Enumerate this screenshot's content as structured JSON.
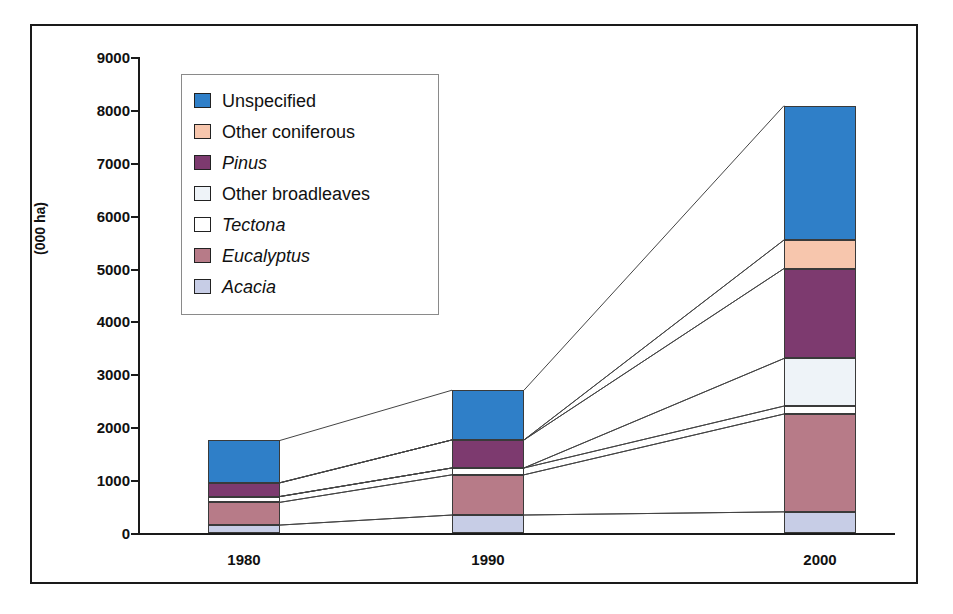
{
  "chart_data": {
    "type": "bar",
    "subtype": "stacked-bar",
    "title": "",
    "subtitle": "",
    "xlabel": "",
    "ylabel": "(000 ha)",
    "categories": [
      "1980",
      "1990",
      "2000"
    ],
    "ylim": [
      0,
      9000
    ],
    "ytick_step": 1000,
    "ytick_labels": [
      "0",
      "1000",
      "2000",
      "3000",
      "4000",
      "5000",
      "6000",
      "7000",
      "8000",
      "9000"
    ],
    "grid": false,
    "legend_position": "upper-left-inside",
    "stack_order_bottom_to_top": [
      "Acacia",
      "Eucalyptus",
      "Tectona",
      "Other broadleaves",
      "Pinus",
      "Other coniferous",
      "Unspecified"
    ],
    "series": [
      {
        "name": "Unspecified",
        "italic": false,
        "color": "#2f7fc8",
        "values": [
          800,
          940,
          2540
        ]
      },
      {
        "name": "Other coniferous",
        "italic": false,
        "color": "#f7c6ad",
        "values": [
          0,
          0,
          540
        ]
      },
      {
        "name": "Pinus",
        "italic": true,
        "color": "#7d3a6f",
        "values": [
          260,
          530,
          1700
        ]
      },
      {
        "name": "Other broadleaves",
        "italic": false,
        "color": "#eef3f8",
        "values": [
          0,
          0,
          900
        ]
      },
      {
        "name": "Tectona",
        "italic": true,
        "color": "#ffffff",
        "values": [
          110,
          130,
          150
        ]
      },
      {
        "name": "Eucalyptus",
        "italic": true,
        "color": "#b77b88",
        "values": [
          430,
          760,
          1850
        ]
      },
      {
        "name": "Acacia",
        "italic": true,
        "color": "#c7cde6",
        "values": [
          150,
          340,
          400
        ]
      }
    ],
    "totals": [
      1750,
      2700,
      8080
    ],
    "connector_lines": true
  },
  "colors": {
    "axis": "#1a1a1a",
    "border": "#1a1a1a",
    "text": "#111111",
    "segment_outline": "#3a3a3a",
    "legend_border": "#8a8a8a",
    "background": "#ffffff"
  }
}
